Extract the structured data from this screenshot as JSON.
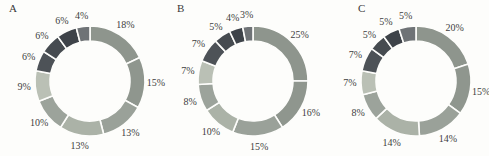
{
  "chart_data": [
    {
      "type": "pie",
      "subtype": "donut",
      "label": "A",
      "unit": "%",
      "start": "12 o'clock",
      "direction": "clockwise",
      "values": [
        18,
        15,
        13,
        13,
        10,
        9,
        6,
        6,
        6,
        4
      ],
      "segment_labels": [
        "18%",
        "15%",
        "13%",
        "13%",
        "10%",
        "9%",
        "6%",
        "6%",
        "6%",
        "4%"
      ],
      "colors": [
        "#8e958d",
        "#8f968e",
        "#9aa199",
        "#abb2a7",
        "#9ca39b",
        "#bac0b5",
        "#4d5257",
        "#464b50",
        "#3e4349",
        "#6f7376"
      ]
    },
    {
      "type": "pie",
      "subtype": "donut",
      "label": "B",
      "unit": "%",
      "start": "12 o'clock",
      "direction": "clockwise",
      "values": [
        25,
        16,
        15,
        10,
        8,
        7,
        7,
        5,
        4,
        3
      ],
      "segment_labels": [
        "25%",
        "16%",
        "15%",
        "10%",
        "8%",
        "7%",
        "7%",
        "5%",
        "4%",
        "3%"
      ],
      "colors": [
        "#8e958d",
        "#8f968e",
        "#9aa199",
        "#abb2a7",
        "#9ca39b",
        "#bac0b5",
        "#4d5257",
        "#464b50",
        "#3e4349",
        "#6f7376"
      ]
    },
    {
      "type": "pie",
      "subtype": "donut",
      "label": "C",
      "unit": "%",
      "start": "12 o'clock",
      "direction": "clockwise",
      "values": [
        20,
        15,
        14,
        14,
        8,
        7,
        7,
        5,
        5,
        5
      ],
      "segment_labels": [
        "20%",
        "15%",
        "14%",
        "14%",
        "8%",
        "7%",
        "7%",
        "5%",
        "5%",
        "5%"
      ],
      "colors": [
        "#8e958d",
        "#8f968e",
        "#9aa199",
        "#abb2a7",
        "#9ca39b",
        "#bac0b5",
        "#4d5257",
        "#464b50",
        "#3e4349",
        "#6f7376"
      ]
    }
  ],
  "figure": {
    "background": "#fdfdfb",
    "gap_color": "#fdfdfb",
    "label_color": "#3e3e3e"
  }
}
